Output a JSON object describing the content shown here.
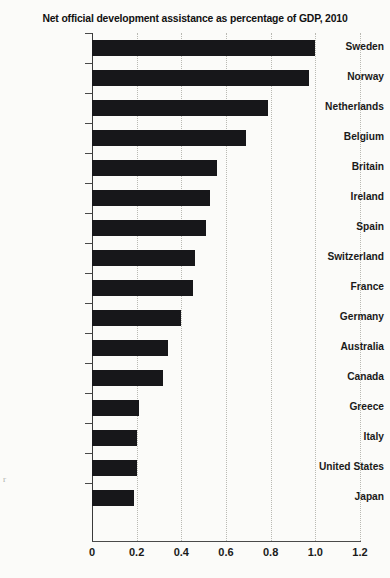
{
  "chart_data": {
    "type": "bar",
    "orientation": "horizontal",
    "title": "Net official development assistance as percentage of GDP, 2010",
    "xlabel": "",
    "ylabel": "",
    "xlim": [
      0,
      1.2
    ],
    "xticks": [
      "0",
      "0.2",
      "0.4",
      "0.6",
      "0.8",
      "1.0",
      "1.2"
    ],
    "xtick_values": [
      0,
      0.2,
      0.4,
      0.6,
      0.8,
      1.0,
      1.2
    ],
    "grid": "vertical-dotted",
    "legend": "none",
    "categories": [
      "Sweden",
      "Norway",
      "Netherlands",
      "Belgium",
      "Britain",
      "Ireland",
      "Spain",
      "Switzerland",
      "France",
      "Germany",
      "Australia",
      "Canada",
      "Greece",
      "Italy",
      "United States",
      "Japan"
    ],
    "values": [
      1.0,
      0.97,
      0.79,
      0.69,
      0.56,
      0.53,
      0.51,
      0.46,
      0.45,
      0.4,
      0.34,
      0.32,
      0.21,
      0.2,
      0.2,
      0.19
    ],
    "bar_color": "#17171a",
    "background_color": "#fbfbf9"
  },
  "artifact": {
    "left_edge_mark": "r"
  }
}
